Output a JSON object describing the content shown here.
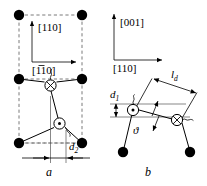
{
  "figure": {
    "caption_panels": [
      "a",
      "b"
    ],
    "panel_a": {
      "letter": "a",
      "axis_vertical_label": "[110]",
      "axis_horizontal_label": "[1́0]",
      "axis_horizontal_label_parts": {
        "pre": "[1",
        "overbar": "1",
        "post": "0]"
      },
      "axis_vertical_label_parts": {
        "pre": "[1",
        "overbar": "",
        "post": "10]"
      },
      "dimension_label": "d",
      "dimension_subscript": "2",
      "atoms_filled_count": 6,
      "atom_crossed_symbol": "⊗",
      "atom_dotted_symbol": "⊙"
    },
    "panel_b": {
      "letter": "b",
      "axis_vertical_label": "[001]",
      "axis_horizontal_label": "[110]",
      "length_label": "l",
      "length_subscript": "d",
      "spacing_label": "d",
      "spacing_subscript": "1",
      "angle_label": "ϑ",
      "atoms_filled_count": 2,
      "atom_crossed_symbol": "⊗",
      "atom_dotted_symbol": "⊙"
    }
  },
  "colors": {
    "ink": "#000000",
    "dashed": "#7a7a7a",
    "hairline": "#555555",
    "background": "#ffffff"
  }
}
